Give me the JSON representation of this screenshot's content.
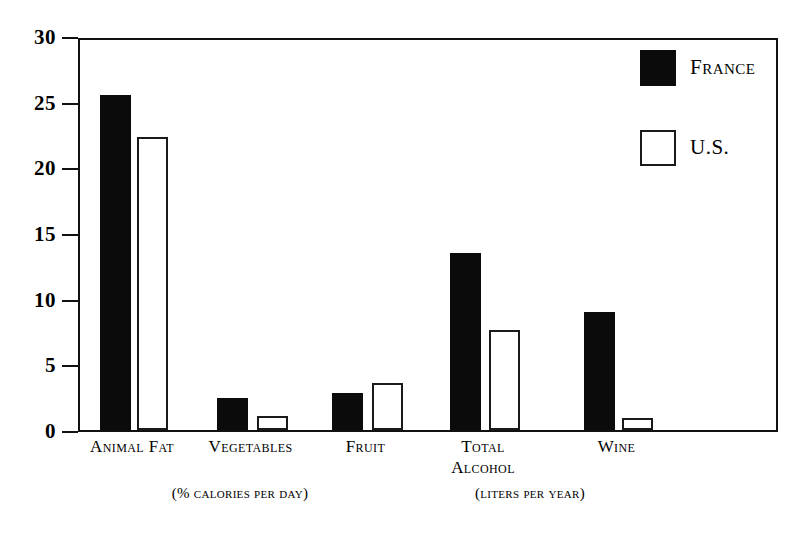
{
  "chart_data": {
    "type": "bar",
    "title": "",
    "xlabel": "",
    "ylabel": "",
    "ylim": [
      0,
      30
    ],
    "yticks": [
      "0",
      "5",
      "10",
      "15",
      "20",
      "25",
      "30"
    ],
    "grid": false,
    "legend_position": "top-right",
    "categories": [
      "Animal Fat",
      "Vegetables",
      "Fruit",
      "Total\nAlcohol",
      "Wine"
    ],
    "series": [
      {
        "name": "France",
        "color": "#0b0b0b",
        "values": [
          25.5,
          2.4,
          2.8,
          13.5,
          9.0
        ]
      },
      {
        "name": "U.S.",
        "color": "#ffffff",
        "values": [
          22.3,
          1.1,
          3.6,
          7.6,
          0.9
        ]
      }
    ],
    "annotations": [
      {
        "text": "(% calories per day)",
        "applies_to": [
          "Animal Fat",
          "Vegetables",
          "Fruit"
        ]
      },
      {
        "text": "(liters per year)",
        "applies_to": [
          "Total Alcohol",
          "Wine"
        ]
      }
    ]
  },
  "axis": {
    "ticks": [
      {
        "label": "30",
        "value": 30
      },
      {
        "label": "25",
        "value": 25
      },
      {
        "label": "20",
        "value": 20
      },
      {
        "label": "15",
        "value": 15
      },
      {
        "label": "10",
        "value": 10
      },
      {
        "label": "5",
        "value": 5
      },
      {
        "label": "0",
        "value": 0
      }
    ]
  },
  "legend": {
    "items": [
      {
        "label": "France",
        "swatch": "filled-black-square"
      },
      {
        "label": "U.S.",
        "swatch": "outlined-white-square"
      }
    ]
  },
  "captions": {
    "left_units": "(% calories per day)",
    "right_units": "(liters per year)"
  },
  "colors": {
    "france_bar": "#0b0b0b",
    "us_bar": "#ffffff",
    "outline": "#1a1a1a",
    "background": "#ffffff"
  }
}
